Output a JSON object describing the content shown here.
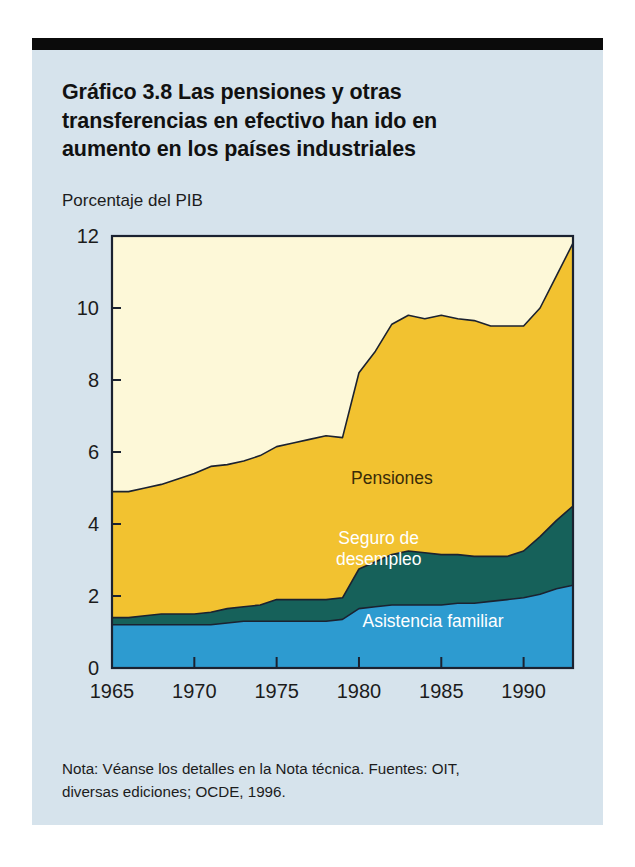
{
  "figure": {
    "title": "Gráfico 3.8  Las pensiones y otras transferencias en efectivo han ido en aumento en los países industriales",
    "title_line1": "Gráfico 3.8  Las pensiones y otras",
    "title_line2": "transferencias en efectivo han ido en",
    "title_line3": "aumento en los países industriales",
    "footnote": "Nota: Véanse los detalles en la Nota técnica. Fuentes: OIT, diversas ediciones; OCDE, 1996.",
    "footnote_line1": "Nota: Véanse los detalles en la Nota técnica. Fuentes: OIT,",
    "footnote_line2": "diversas ediciones; OCDE, 1996."
  },
  "colors": {
    "panel_background": "#d6e3ec",
    "plot_background": "#fdf8d8",
    "pensiones": "#f2c230",
    "seguro_desempleo": "#16615a",
    "asistencia_familiar": "#2d9bd0",
    "outline": "#1b2230",
    "rule": "#0b0b0b",
    "text": "#1c1c1c",
    "label_on_yellow": "#3a2c08",
    "label_on_dark": "#ffffff"
  },
  "chart_data": {
    "type": "area",
    "stacked": true,
    "title": "Gráfico 3.8  Las pensiones y otras transferencias en efectivo han ido en aumento en los países industriales",
    "subtitle": "",
    "xlabel": "",
    "ylabel": "Porcentaje del PIB",
    "ylabel_position": "above-axis",
    "grid": false,
    "legend": "inline-annotations",
    "xlim": [
      1965,
      1993
    ],
    "ylim": [
      0,
      12
    ],
    "yticks": [
      0,
      2,
      4,
      6,
      8,
      10,
      12
    ],
    "ytick_labels": [
      "0",
      "2",
      "4",
      "6",
      "8",
      "10",
      "12"
    ],
    "xticks": [
      1965,
      1970,
      1975,
      1980,
      1985,
      1990
    ],
    "xtick_labels": [
      "1965",
      "1970",
      "1975",
      "1980",
      "1985",
      "1990"
    ],
    "x": [
      1965,
      1966,
      1967,
      1968,
      1969,
      1970,
      1971,
      1972,
      1973,
      1974,
      1975,
      1976,
      1977,
      1978,
      1979,
      1980,
      1981,
      1982,
      1983,
      1984,
      1985,
      1986,
      1987,
      1988,
      1989,
      1990,
      1991,
      1992,
      1993
    ],
    "series": [
      {
        "name": "Asistencia familiar",
        "color": "#2d9bd0",
        "order": 1,
        "values": [
          1.2,
          1.2,
          1.2,
          1.2,
          1.2,
          1.2,
          1.2,
          1.25,
          1.3,
          1.3,
          1.3,
          1.3,
          1.3,
          1.3,
          1.35,
          1.65,
          1.7,
          1.75,
          1.75,
          1.75,
          1.75,
          1.8,
          1.8,
          1.85,
          1.9,
          1.95,
          2.05,
          2.2,
          2.3
        ]
      },
      {
        "name": "Seguro de desempleo",
        "color": "#16615a",
        "order": 2,
        "values": [
          0.2,
          0.2,
          0.25,
          0.3,
          0.3,
          0.3,
          0.35,
          0.4,
          0.4,
          0.45,
          0.6,
          0.6,
          0.6,
          0.6,
          0.6,
          1.1,
          1.25,
          1.4,
          1.5,
          1.45,
          1.4,
          1.35,
          1.3,
          1.25,
          1.2,
          1.3,
          1.6,
          1.9,
          2.2
        ]
      },
      {
        "name": "Pensiones",
        "color": "#f2c230",
        "order": 3,
        "values": [
          3.5,
          3.5,
          3.55,
          3.6,
          3.75,
          3.9,
          4.05,
          4.0,
          4.05,
          4.15,
          4.25,
          4.35,
          4.45,
          4.55,
          4.45,
          5.45,
          5.85,
          6.4,
          6.55,
          6.5,
          6.65,
          6.55,
          6.55,
          6.4,
          6.4,
          6.25,
          6.35,
          6.8,
          7.3
        ]
      }
    ],
    "cumulative_tops": {
      "asistencia_familiar": [
        1.2,
        1.2,
        1.2,
        1.2,
        1.2,
        1.2,
        1.2,
        1.25,
        1.3,
        1.3,
        1.3,
        1.3,
        1.3,
        1.3,
        1.35,
        1.65,
        1.7,
        1.75,
        1.75,
        1.75,
        1.75,
        1.8,
        1.8,
        1.85,
        1.9,
        1.95,
        2.05,
        2.2,
        2.3
      ],
      "seguro_desempleo": [
        1.4,
        1.4,
        1.45,
        1.5,
        1.5,
        1.5,
        1.55,
        1.65,
        1.7,
        1.75,
        1.9,
        1.9,
        1.9,
        1.9,
        1.95,
        2.75,
        2.95,
        3.15,
        3.25,
        3.2,
        3.15,
        3.15,
        3.1,
        3.1,
        3.1,
        3.25,
        3.65,
        4.1,
        4.5
      ],
      "pensiones": [
        4.9,
        4.9,
        5.0,
        5.1,
        5.25,
        5.4,
        5.6,
        5.65,
        5.75,
        5.9,
        6.15,
        6.25,
        6.35,
        6.45,
        6.4,
        8.2,
        8.8,
        9.55,
        9.8,
        9.7,
        9.8,
        9.7,
        9.65,
        9.5,
        9.5,
        9.5,
        10.0,
        10.9,
        11.8
      ]
    },
    "annotations": [
      {
        "name": "Pensiones",
        "text": "Pensiones",
        "x": 1982,
        "y": 5.1,
        "color": "#3a2c08",
        "anchor": "middle"
      },
      {
        "name": "Seguro de desempleo",
        "text": "Seguro de",
        "x": 1981.2,
        "y": 3.45,
        "color": "#ffffff",
        "anchor": "middle"
      },
      {
        "name": "Seguro de desempleo",
        "text": "desempleo",
        "x": 1981.2,
        "y": 2.85,
        "color": "#ffffff",
        "anchor": "middle"
      },
      {
        "name": "Asistencia familiar",
        "text": "Asistencia familiar",
        "x": 1984.5,
        "y": 1.15,
        "color": "#ffffff",
        "anchor": "middle"
      }
    ]
  }
}
